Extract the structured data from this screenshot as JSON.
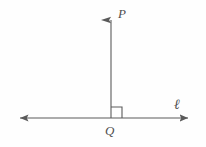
{
  "figure": {
    "type": "geometry-diagram",
    "width": 206,
    "height": 147,
    "background_color": "#fefefe",
    "stroke_color": "#5a5a5a",
    "label_color": "#4f4f4f",
    "labels": {
      "point_p": "P",
      "point_q": "Q",
      "line_ell": "ℓ"
    },
    "elements": {
      "horizontal_line": {
        "name": "line-ell",
        "x1": 12,
        "y1": 118,
        "x2": 196,
        "y2": 118,
        "arrow_start": true,
        "arrow_end": true
      },
      "vertical_ray": {
        "name": "ray-qp",
        "x1": 111,
        "y1": 118,
        "x2": 111,
        "y2": 9,
        "arrow_start": false,
        "arrow_end": true
      },
      "right_angle_marker": {
        "name": "right-angle-square",
        "x": 111,
        "y": 107,
        "size": 11,
        "position": "upper-right of intersection"
      },
      "intersection_point": {
        "name": "point-q",
        "x": 111,
        "y": 118
      }
    }
  }
}
